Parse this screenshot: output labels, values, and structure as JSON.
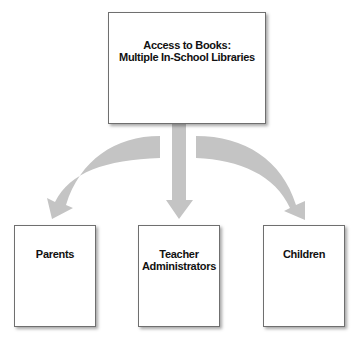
{
  "diagram": {
    "root": {
      "label": "Access to Books:\nMultiple In-School Libraries"
    },
    "children": [
      {
        "label": "Parents"
      },
      {
        "label": "Teacher\nAdministrators"
      },
      {
        "label": "Children"
      }
    ],
    "colors": {
      "arrow": "#c4c4c4",
      "box_border": "#6f6f6f",
      "text": "#111111",
      "background": "#ffffff"
    }
  }
}
